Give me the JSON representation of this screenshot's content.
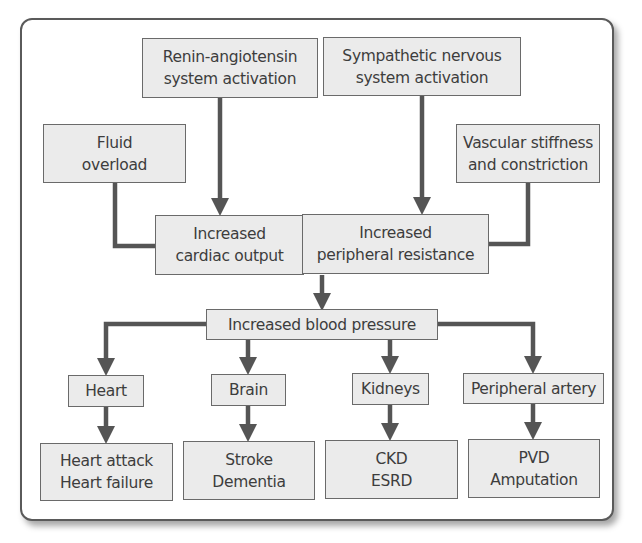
{
  "diagram": {
    "type": "flowchart",
    "colors": {
      "box_fill": "#ebebeb",
      "box_border": "#6a6a6a",
      "connector": "#555555",
      "frame_border": "#5a5a5a"
    },
    "causes": {
      "renin": "Renin-angiotensin\nsystem activation",
      "sympathetic": "Sympathetic nervous\nsystem activation",
      "fluid": "Fluid\noverload",
      "vascular": "Vascular stiffness\nand constriction"
    },
    "mechanisms": {
      "cardiac_output": "Increased\ncardiac output",
      "peripheral_resistance": "Increased\nperipheral resistance"
    },
    "central": {
      "blood_pressure": "Increased blood pressure"
    },
    "organs": [
      {
        "label": "Heart",
        "outcome": "Heart attack\nHeart failure"
      },
      {
        "label": "Brain",
        "outcome": "Stroke\nDementia"
      },
      {
        "label": "Kidneys",
        "outcome": "CKD\nESRD"
      },
      {
        "label": "Peripheral artery",
        "outcome": "PVD\nAmputation"
      }
    ]
  }
}
